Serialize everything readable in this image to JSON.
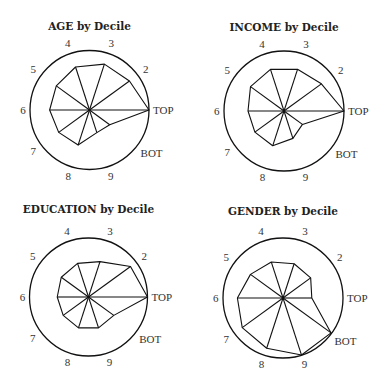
{
  "chart_data": [
    {
      "type": "radar",
      "title": "AGE by Decile",
      "axis_order": [
        "TOP",
        "2",
        "3",
        "4",
        "5",
        "6",
        "7",
        "8",
        "9",
        "BOT"
      ],
      "direction": "counter-clockwise starting at right",
      "values": [
        1.0,
        0.83,
        0.81,
        0.76,
        0.69,
        0.67,
        0.64,
        0.62,
        0.4,
        0.42
      ],
      "range": [
        0,
        1
      ],
      "grid": false
    },
    {
      "type": "radar",
      "title": "INCOME by Decile",
      "axis_order": [
        "TOP",
        "2",
        "3",
        "4",
        "5",
        "6",
        "7",
        "8",
        "9",
        "BOT"
      ],
      "direction": "counter-clockwise starting at right",
      "values": [
        1.0,
        0.77,
        0.73,
        0.73,
        0.69,
        0.6,
        0.6,
        0.61,
        0.48,
        0.38
      ],
      "range": [
        0,
        1
      ],
      "grid": false
    },
    {
      "type": "radar",
      "title": "EDUCATION by Decile",
      "axis_order": [
        "TOP",
        "2",
        "3",
        "4",
        "5",
        "6",
        "7",
        "8",
        "9",
        "BOT"
      ],
      "direction": "counter-clockwise starting at right",
      "values": [
        1.0,
        0.88,
        0.63,
        0.6,
        0.57,
        0.53,
        0.53,
        0.55,
        0.55,
        0.53
      ],
      "range": [
        0,
        1
      ],
      "grid": false
    },
    {
      "type": "radar",
      "title": "GENDER by Decile",
      "axis_order": [
        "TOP",
        "2",
        "3",
        "4",
        "5",
        "6",
        "7",
        "8",
        "9",
        "BOT"
      ],
      "direction": "counter-clockwise starting at right",
      "values": [
        0.48,
        0.57,
        0.6,
        0.63,
        0.67,
        0.76,
        0.84,
        0.88,
        1.0,
        0.99
      ],
      "range": [
        0,
        1
      ],
      "grid": false
    }
  ]
}
